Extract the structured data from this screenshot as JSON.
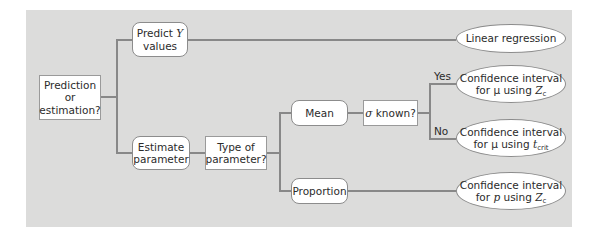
{
  "diagram": {
    "title": "",
    "colors": {
      "panel": "#dcdcdb",
      "line": "#888888",
      "node": "#ffffff"
    },
    "nodes": {
      "root": {
        "line1": "Prediction",
        "line2": "or",
        "line3": "estimation?"
      },
      "predict": {
        "line1_pre": "Predict ",
        "line1_var": "Y",
        "line2": "values"
      },
      "estimate": {
        "line1": "Estimate",
        "line2": "parameter"
      },
      "type": {
        "line1": "Type of",
        "line2": "parameter?"
      },
      "mean": {
        "label": "Mean"
      },
      "sigma": {
        "symbol": "σ",
        "text": " known?"
      },
      "proportion": {
        "label": "Proportion"
      },
      "linreg": {
        "label": "Linear regression"
      },
      "ci_z": {
        "line1": "Confidence interval",
        "line2_pre": "for μ using ",
        "var": "Z",
        "sub": "c"
      },
      "ci_t": {
        "line1": "Confidence interval",
        "line2_pre": "for μ using ",
        "var": "t",
        "sub": "crit"
      },
      "ci_p": {
        "line1": "Confidence interval",
        "line2_pre": "for ",
        "pvar": "p",
        "line2_mid": " using ",
        "var": "Z",
        "sub": "c"
      }
    },
    "edge_labels": {
      "yes": "Yes",
      "no": "No"
    }
  }
}
